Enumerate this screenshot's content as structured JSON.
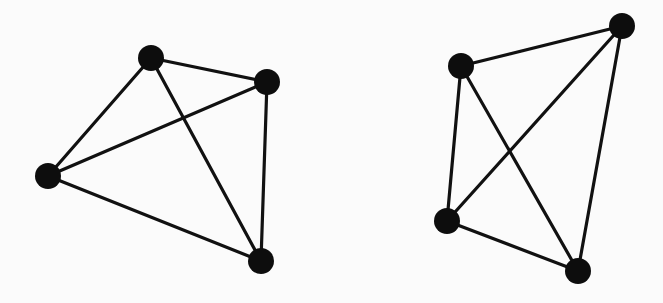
{
  "graphs": [
    {
      "name": "left-graph",
      "nodes": [
        {
          "id": "A",
          "x": 151,
          "y": 58
        },
        {
          "id": "B",
          "x": 267,
          "y": 82
        },
        {
          "id": "C",
          "x": 48,
          "y": 176
        },
        {
          "id": "D",
          "x": 261,
          "y": 261
        }
      ],
      "edges": [
        [
          "A",
          "B"
        ],
        [
          "A",
          "C"
        ],
        [
          "A",
          "D"
        ],
        [
          "B",
          "C"
        ],
        [
          "B",
          "D"
        ],
        [
          "C",
          "D"
        ]
      ]
    },
    {
      "name": "right-graph",
      "nodes": [
        {
          "id": "E",
          "x": 461,
          "y": 66
        },
        {
          "id": "F",
          "x": 622,
          "y": 26
        },
        {
          "id": "G",
          "x": 447,
          "y": 221
        },
        {
          "id": "H",
          "x": 578,
          "y": 271
        }
      ],
      "edges": [
        [
          "E",
          "F"
        ],
        [
          "E",
          "G"
        ],
        [
          "E",
          "H"
        ],
        [
          "F",
          "G"
        ],
        [
          "F",
          "H"
        ],
        [
          "G",
          "H"
        ]
      ]
    }
  ],
  "style": {
    "node_radius": 13,
    "node_color": "#0d0d0d",
    "edge_color": "#111111",
    "background": "#fbfbfb"
  }
}
